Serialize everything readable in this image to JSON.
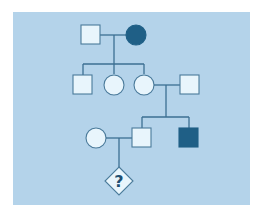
{
  "diagram": {
    "type": "pedigree",
    "background_color": "#b4d3ea",
    "affected_color": "#1f5f86",
    "unaffected_color": "#e8f5fc",
    "line_color": "#3c6f92",
    "generations": [
      {
        "id": "I",
        "individuals": [
          {
            "id": "I-1",
            "sex": "male",
            "affected": false
          },
          {
            "id": "I-2",
            "sex": "female",
            "affected": true
          }
        ]
      },
      {
        "id": "II",
        "individuals": [
          {
            "id": "II-1",
            "sex": "male",
            "affected": false
          },
          {
            "id": "II-2",
            "sex": "female",
            "affected": false
          },
          {
            "id": "II-3",
            "sex": "female",
            "affected": false
          },
          {
            "id": "II-4",
            "sex": "male",
            "affected": false,
            "note": "spouse of II-3"
          }
        ]
      },
      {
        "id": "III",
        "individuals": [
          {
            "id": "III-1",
            "sex": "female",
            "affected": false,
            "note": "spouse of III-2"
          },
          {
            "id": "III-2",
            "sex": "male",
            "affected": false
          },
          {
            "id": "III-3",
            "sex": "male",
            "affected": true
          }
        ]
      },
      {
        "id": "IV",
        "individuals": [
          {
            "id": "IV-1",
            "sex": "unknown",
            "affected": null,
            "label": "?"
          }
        ]
      }
    ]
  }
}
